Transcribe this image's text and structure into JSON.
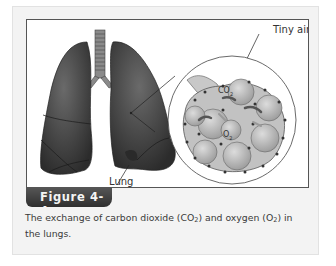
{
  "figure": {
    "label": "Figure 4-4",
    "caption_parts": {
      "p1": "The exchange of carbon dioxide (CO",
      "sub1": "2",
      "p2": ") and oxygen (O",
      "sub2": "2",
      "p3": ") in the lungs."
    },
    "illustration": {
      "labels": {
        "air_sac": "Tiny air sac",
        "lung": "Lung",
        "co2": "CO",
        "co2_sub": "2",
        "o2": "O",
        "o2_sub": "2"
      }
    }
  },
  "colors": {
    "panel_bg": "#f3f3f3",
    "frame_border": "#555555",
    "badge_bg": "#3a3a3a",
    "lung_fill": "#4a4a4a",
    "alveoli_fill": "#bdbdbd"
  }
}
